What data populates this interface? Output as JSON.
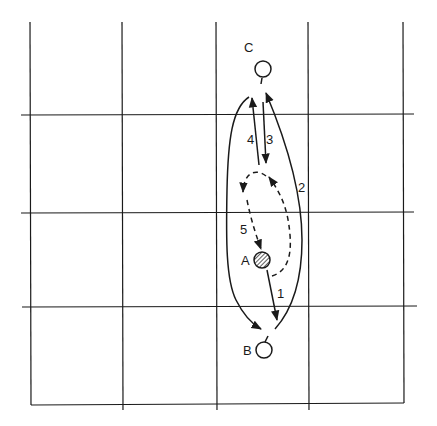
{
  "diagram": {
    "type": "grid-movement-diagram",
    "grid": {
      "vertical_lines_x": [
        30,
        122,
        216,
        308,
        403
      ],
      "horizontal_lines_y": [
        115,
        212,
        306,
        405
      ],
      "top_y": 22,
      "left_x": 20,
      "right_x": 415
    },
    "nodes": [
      {
        "id": "A",
        "label": "A",
        "style": "hatched"
      },
      {
        "id": "B",
        "label": "B",
        "style": "open"
      },
      {
        "id": "C",
        "label": "C",
        "style": "open"
      }
    ],
    "paths": [
      {
        "label": "1",
        "from": "A",
        "to": "B",
        "style": "solid"
      },
      {
        "label": "2",
        "from": "B",
        "to": "C",
        "style": "solid"
      },
      {
        "label": "3",
        "from": "C",
        "to": "A",
        "style": "solid"
      },
      {
        "label": "4",
        "from": "A",
        "to": "C",
        "style": "solid"
      },
      {
        "label": "5",
        "from": "A",
        "to": "A",
        "style": "dashed"
      }
    ],
    "outer_path": {
      "from": "C",
      "to": "B",
      "style": "solid"
    },
    "colors": {
      "line": "#1a1a1a",
      "background": "#ffffff"
    }
  }
}
